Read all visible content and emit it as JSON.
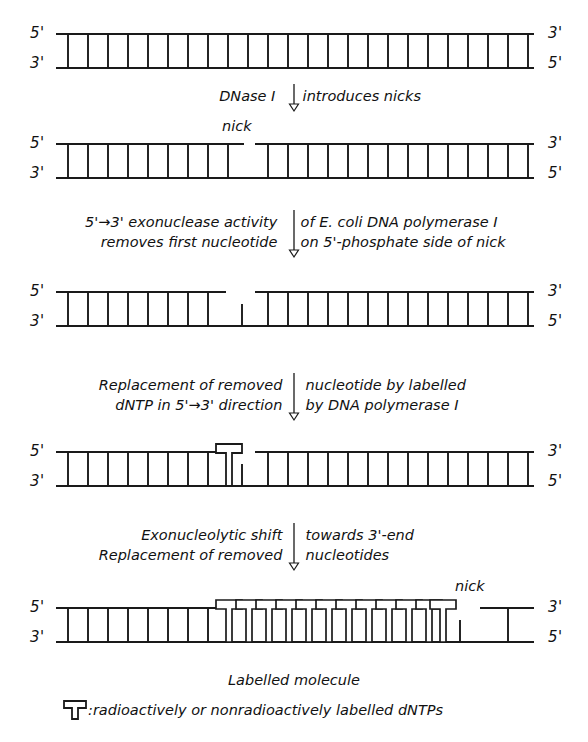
{
  "figure": {
    "title_semantic": "nick-translation-diagram",
    "ink_color": "#1a1a1a",
    "background": "#ffffff"
  },
  "strand_labels": {
    "five_prime": "5'",
    "three_prime": "3'"
  },
  "rows": [
    {
      "id": "row1-intact-duplex",
      "left_top": "5'",
      "left_bottom": "3'",
      "right_top": "3'",
      "right_bottom": "5'",
      "nick_label": null
    },
    {
      "id": "row2-nicked-duplex",
      "left_top": "5'",
      "left_bottom": "3'",
      "right_top": "3'",
      "right_bottom": "5'",
      "nick_label": "nick"
    },
    {
      "id": "row3-nucleotide-removed",
      "left_top": "5'",
      "left_bottom": "3'",
      "right_top": "3'",
      "right_bottom": "5'",
      "nick_label": null
    },
    {
      "id": "row4-single-labelled-nucleotide",
      "left_top": "5'",
      "left_bottom": "3'",
      "right_top": "3'",
      "right_bottom": "5'",
      "nick_label": null
    },
    {
      "id": "row5-labelled-molecule",
      "left_top": "5'",
      "left_bottom": "3'",
      "right_top": "3'",
      "right_bottom": "5'",
      "nick_label": "nick"
    }
  ],
  "steps": [
    {
      "id": "step-dnase",
      "lines": [
        {
          "left": "DNase I",
          "right": "introduces nicks"
        }
      ]
    },
    {
      "id": "step-exonuclease",
      "lines": [
        {
          "left": "5'→3' exonuclease activity",
          "right": "of E. coli DNA polymerase I"
        },
        {
          "left": "removes first nucleotide",
          "right": "on 5'-phosphate side of nick"
        }
      ]
    },
    {
      "id": "step-replacement",
      "lines": [
        {
          "left": "Replacement of removed",
          "right": "nucleotide by labelled"
        },
        {
          "left": "dNTP in 5'→3' direction",
          "right": "by DNA polymerase I"
        }
      ]
    },
    {
      "id": "step-exonucleolytic-shift",
      "lines": [
        {
          "left": "Exonucleolytic shift",
          "right": "towards 3'-end"
        },
        {
          "left": "Replacement of removed",
          "right": "nucleotides"
        }
      ]
    }
  ],
  "caption": "Labelled molecule",
  "legend": {
    "symbol_name": "labelled-dntp-symbol",
    "text": ":radioactively or nonradioactively labelled dNTPs"
  }
}
